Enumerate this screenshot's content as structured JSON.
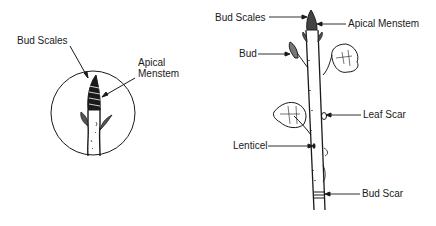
{
  "diagram": {
    "left_figure": {
      "title": "Terminal bud close-up",
      "labels": {
        "bud_scales": "Bud Scales",
        "apical_meristem_line1": "Apical",
        "apical_meristem_line2": "Menstem"
      }
    },
    "right_figure": {
      "title": "Twig",
      "labels": {
        "bud_scales": "Bud Scales",
        "apical_meristem": "Apical Menstem",
        "bud": "Bud",
        "leaf_scar": "Leaf Scar",
        "lenticel": "Lenticel",
        "bud_scar": "Bud Scar"
      }
    },
    "colors": {
      "ink": "#1a1a1a",
      "background": "#ffffff"
    }
  }
}
